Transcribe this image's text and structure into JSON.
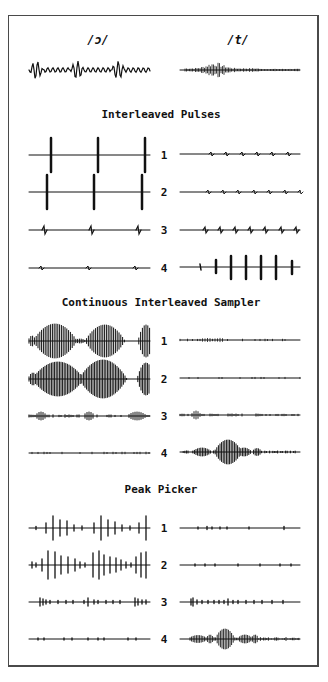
{
  "phonemes": {
    "left": "/ɔ/",
    "right": "/t/"
  },
  "sections": [
    {
      "title": "Interleaved Pulses",
      "channels": [
        "1",
        "2",
        "3",
        "4"
      ]
    },
    {
      "title": "Continuous Interleaved Sampler",
      "channels": [
        "1",
        "2",
        "3",
        "4"
      ]
    },
    {
      "title": "Peak Picker",
      "channels": [
        "1",
        "2",
        "3",
        "4"
      ]
    }
  ],
  "colors": {
    "ink": "#111111",
    "frame": "#4a4a4a",
    "background": "#ffffff"
  }
}
